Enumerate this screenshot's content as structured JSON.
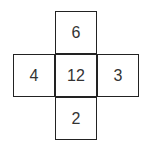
{
  "diagram": {
    "type": "cross-shaped number grid",
    "cells": {
      "top": "6",
      "left": "4",
      "center": "12",
      "right": "3",
      "bottom": "2"
    }
  }
}
